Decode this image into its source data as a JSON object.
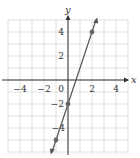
{
  "chart_data": {
    "type": "line",
    "title": "",
    "xlabel": "x",
    "ylabel": "y",
    "xlim": [
      -5,
      5
    ],
    "ylim": [
      -6,
      5
    ],
    "grid": true,
    "x_ticks": [
      -4,
      -2,
      0,
      2,
      4
    ],
    "y_ticks": [
      -4,
      -2,
      2,
      4
    ],
    "tick_labels": {
      "x": [
        "−4",
        "−2",
        "0",
        "2",
        "4"
      ],
      "y": [
        "4",
        "2",
        "−2",
        "−4"
      ]
    },
    "series": [
      {
        "name": "y = 3x − 2",
        "x": [
          -1,
          0,
          2
        ],
        "y": [
          -5,
          -2,
          4
        ],
        "points_marked": [
          [
            2,
            4
          ],
          [
            0,
            -2
          ],
          [
            -1,
            -5
          ]
        ]
      }
    ],
    "colors": {
      "grid": "#d9d9d9",
      "axis": "#333333",
      "line": "#555555",
      "point": "#666666"
    }
  }
}
